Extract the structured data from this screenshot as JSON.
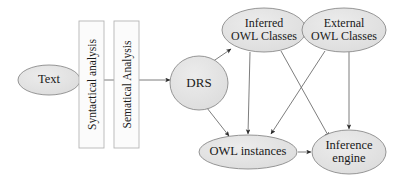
{
  "diagram": {
    "type": "flowchart",
    "canvas": {
      "width": 397,
      "height": 184
    },
    "style": {
      "ellipse_fill": "#e2e2e2",
      "ellipse_stroke": "#8a8a8a",
      "box_fill": "#fbfbfb",
      "box_stroke": "#b5b5b5",
      "edge_color": "#6e6e6e",
      "text_color": "#1a1a1a",
      "background": "#ffffff"
    },
    "nodes": [
      {
        "id": "text",
        "label": "Text",
        "shape": "ellipse",
        "cx": 49,
        "cy": 80,
        "rx": 31,
        "ry": 15,
        "font_size": 12.5
      },
      {
        "id": "syntactical_analysis",
        "label": "Syntactical analysis",
        "shape": "rect-vertical",
        "x": 79,
        "y": 21,
        "w": 25,
        "h": 127,
        "font_size": 11.5,
        "rotation": -90
      },
      {
        "id": "sematical_analysis",
        "label": "Sematical Analysis",
        "shape": "rect-vertical",
        "x": 114,
        "y": 21,
        "w": 25,
        "h": 127,
        "font_size": 11.5,
        "rotation": -90
      },
      {
        "id": "drs",
        "label": "DRS",
        "shape": "ellipse",
        "cx": 199,
        "cy": 83,
        "rx": 29,
        "ry": 27,
        "font_size": 13
      },
      {
        "id": "inferred_owl_classes",
        "label": "Inferred\nOWL Classes",
        "shape": "ellipse",
        "cx": 264,
        "cy": 30,
        "rx": 42,
        "ry": 22,
        "font_size": 12
      },
      {
        "id": "external_owl_classes",
        "label": "External\nOWL Classes",
        "shape": "ellipse",
        "cx": 344,
        "cy": 30,
        "rx": 42,
        "ry": 22,
        "font_size": 12
      },
      {
        "id": "owl_instances",
        "label": "OWL instances",
        "shape": "ellipse",
        "cx": 248,
        "cy": 152,
        "rx": 49,
        "ry": 17,
        "font_size": 12.5
      },
      {
        "id": "inference_engine",
        "label": "Inference\nengine",
        "shape": "ellipse",
        "cx": 349,
        "cy": 152,
        "rx": 37,
        "ry": 22,
        "font_size": 12.5
      }
    ],
    "edges": [
      {
        "id": "e-text-pipeline",
        "from": "text",
        "to": "drs",
        "label": "",
        "path": "M 80 80 L 170 80",
        "arrow": true
      },
      {
        "id": "e-drs-inferred",
        "from": "drs",
        "to": "inferred_owl_classes",
        "label": "",
        "path": "M 212 62 L 231 49",
        "arrow": true
      },
      {
        "id": "e-drs-owlinstances",
        "from": "drs",
        "to": "owl_instances",
        "label": "",
        "path": "M 207 108 L 229 136",
        "arrow": true
      },
      {
        "id": "e-inferred-owlinstances",
        "from": "inferred_owl_classes",
        "to": "owl_instances",
        "label": "",
        "path": "M 250 52 L 248 134",
        "arrow": true
      },
      {
        "id": "e-inferred-inference",
        "from": "inferred_owl_classes",
        "to": "inference_engine",
        "label": "",
        "path": "M 281 51 L 329 137",
        "arrow": true
      },
      {
        "id": "e-external-owlinstances",
        "from": "external_owl_classes",
        "to": "owl_instances",
        "label": "",
        "path": "M 325 51 L 271 134",
        "arrow": true
      },
      {
        "id": "e-external-inference",
        "from": "external_owl_classes",
        "to": "inference_engine",
        "label": "",
        "path": "M 349 52 L 349 129",
        "arrow": true
      },
      {
        "id": "e-owlinstances-inference",
        "from": "owl_instances",
        "to": "inference_engine",
        "label": "",
        "path": "M 298 152 L 311 152",
        "arrow": true
      }
    ]
  }
}
